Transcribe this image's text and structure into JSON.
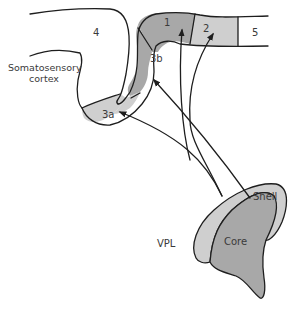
{
  "diagram": {
    "type": "neuroanatomy-projection",
    "colors": {
      "background": "#ffffff",
      "dark_region": "#a8a8a8",
      "light_region": "#cfcfcf",
      "line": "#1e1e1e",
      "text": "#3a3a3a"
    },
    "cortex": {
      "label_line1": "Somatosensory",
      "label_line2": "cortex",
      "areas": [
        {
          "id": "4",
          "label": "4",
          "shade": "none"
        },
        {
          "id": "3a",
          "label": "3a",
          "shade": "light"
        },
        {
          "id": "3b",
          "label": "3b",
          "shade": "dark"
        },
        {
          "id": "1",
          "label": "1",
          "shade": "dark"
        },
        {
          "id": "2",
          "label": "2",
          "shade": "light"
        },
        {
          "id": "5",
          "label": "5",
          "shade": "none"
        }
      ]
    },
    "thalamus": {
      "nucleus_label": "VPL",
      "regions": [
        {
          "id": "shell",
          "label": "Shell",
          "shade": "light"
        },
        {
          "id": "core",
          "label": "Core",
          "shade": "dark"
        }
      ]
    },
    "projections": [
      {
        "from": "shell",
        "to": "3a"
      },
      {
        "from": "shell",
        "to": "2"
      },
      {
        "from": "core",
        "to": "3b"
      },
      {
        "from": "core",
        "to": "1"
      }
    ]
  }
}
